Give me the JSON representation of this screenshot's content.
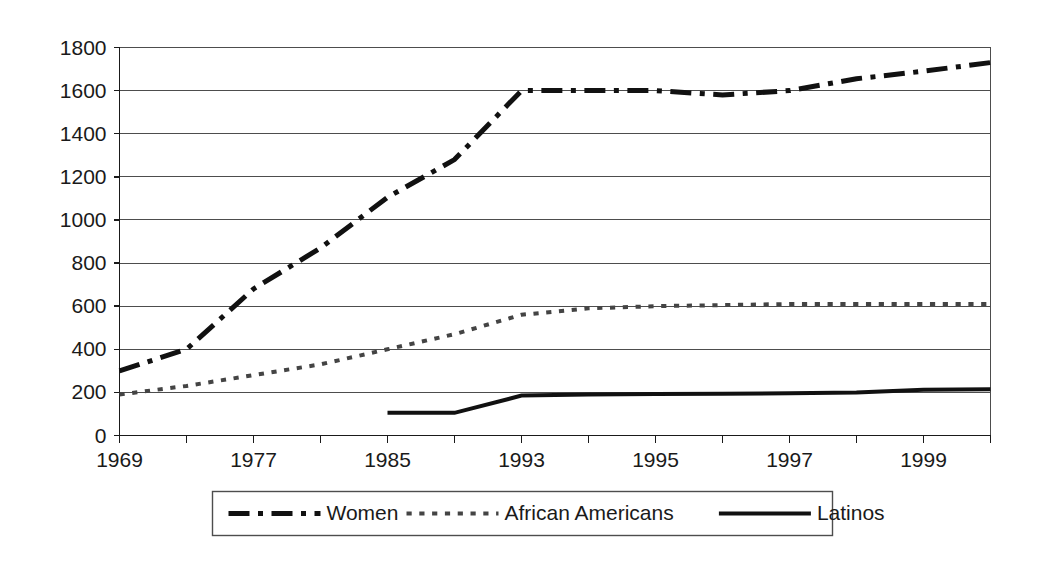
{
  "chart_data": {
    "type": "line",
    "title": "",
    "subtitle": "",
    "xlabel": "",
    "ylabel": "",
    "xlim": [
      1969,
      2000
    ],
    "ylim": [
      0,
      1800
    ],
    "grid": true,
    "legend_position": "bottom",
    "y_ticks": [
      0,
      200,
      400,
      600,
      800,
      1000,
      1200,
      1400,
      1600,
      1800
    ],
    "y_tick_labels": [
      "0",
      "200",
      "400",
      "600",
      "800",
      "1000",
      "1200",
      "1400",
      "1600",
      "1800"
    ],
    "x_ticks": [
      1969,
      1973,
      1977,
      1981,
      1985,
      1989,
      1993,
      1994,
      1995,
      1996,
      1997,
      1998,
      1999,
      2000
    ],
    "x_tick_labels": [
      "1969",
      "",
      "1977",
      "",
      "1985",
      "",
      "1993",
      "",
      "1995",
      "",
      "1997",
      "",
      "1999",
      ""
    ],
    "series": [
      {
        "name": "Women",
        "style": "dash-dot",
        "color": "#111111",
        "width": 5,
        "x": [
          1969,
          1973,
          1977,
          1981,
          1985,
          1989,
          1993,
          1994,
          1995,
          1996,
          1997,
          1998,
          1999,
          2000
        ],
        "values": [
          300,
          400,
          680,
          870,
          1105,
          1280,
          1600,
          1600,
          1600,
          1580,
          1600,
          1655,
          1690,
          1730
        ]
      },
      {
        "name": "African Americans",
        "style": "dotted",
        "color": "#444444",
        "width": 4,
        "x": [
          1969,
          1973,
          1977,
          1981,
          1985,
          1989,
          1993,
          1994,
          1995,
          1996,
          1997,
          1998,
          1999,
          2000
        ],
        "values": [
          190,
          230,
          280,
          330,
          400,
          470,
          560,
          590,
          600,
          605,
          610,
          610,
          610,
          610
        ]
      },
      {
        "name": "Latinos",
        "style": "solid",
        "color": "#111111",
        "width": 4,
        "x": [
          1985,
          1989,
          1993,
          1994,
          1995,
          1996,
          1997,
          1998,
          1999,
          2000
        ],
        "values": [
          105,
          105,
          185,
          190,
          192,
          194,
          196,
          200,
          212,
          215
        ]
      }
    ]
  },
  "legend": {
    "entries": [
      {
        "label": "Women",
        "sample": "dash-dot"
      },
      {
        "label": "African Americans",
        "sample": "dotted"
      },
      {
        "label": "Latinos",
        "sample": "solid"
      }
    ]
  }
}
